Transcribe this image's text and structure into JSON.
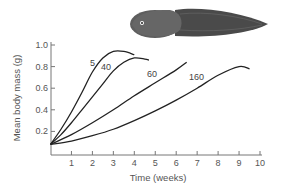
{
  "chart_data": {
    "type": "line",
    "title": "",
    "xlabel": "Time (weeks)",
    "ylabel": "Mean body mass (g)",
    "xlim": [
      0,
      10
    ],
    "ylim": [
      0,
      1.0
    ],
    "x_ticks": [
      "1",
      "2",
      "3",
      "4",
      "5",
      "6",
      "7",
      "8",
      "9",
      "10"
    ],
    "y_ticks": [
      "0.2",
      "0.4",
      "0.6",
      "0.8",
      "1.0"
    ],
    "grid": false,
    "legend": "inline labels on curves (tadpole density)",
    "series": [
      {
        "name": "5",
        "x": [
          0,
          0.5,
          1,
          1.5,
          2,
          2.5,
          3,
          3.5,
          4.0
        ],
        "y": [
          0.08,
          0.22,
          0.38,
          0.56,
          0.75,
          0.88,
          0.94,
          0.94,
          0.91
        ]
      },
      {
        "name": "40",
        "x": [
          0,
          0.5,
          1,
          1.5,
          2,
          2.5,
          3,
          3.5,
          4,
          4.5,
          4.7
        ],
        "y": [
          0.08,
          0.17,
          0.28,
          0.4,
          0.52,
          0.64,
          0.76,
          0.84,
          0.88,
          0.87,
          0.86
        ]
      },
      {
        "name": "60",
        "x": [
          0,
          1,
          2,
          3,
          4,
          5,
          6,
          6.5
        ],
        "y": [
          0.08,
          0.17,
          0.28,
          0.4,
          0.53,
          0.65,
          0.77,
          0.84
        ]
      },
      {
        "name": "160",
        "x": [
          0,
          1,
          2,
          3,
          4,
          5,
          6,
          7,
          8,
          9,
          9.5
        ],
        "y": [
          0.08,
          0.11,
          0.16,
          0.22,
          0.3,
          0.39,
          0.49,
          0.6,
          0.72,
          0.8,
          0.78
        ]
      }
    ],
    "annotation": "tadpole illustration"
  }
}
